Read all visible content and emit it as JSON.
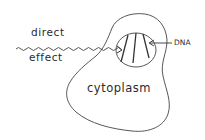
{
  "diagram": {
    "labels": {
      "direct": "direct",
      "effect": "effect",
      "dna": "DNA",
      "cytoplasm": "cytoplasm"
    },
    "elements": {
      "radiation_wave": "wavy line representing direct effect of radiation",
      "cell_outline": "irregular cell membrane outline",
      "nucleus": "oval nucleus containing DNA strands",
      "dna_strands": 3,
      "arrows": [
        "wave arrow pointing into nucleus",
        "arrow from DNA label to strand"
      ]
    },
    "colors": {
      "line": "#333333",
      "background": "#ffffff"
    }
  }
}
